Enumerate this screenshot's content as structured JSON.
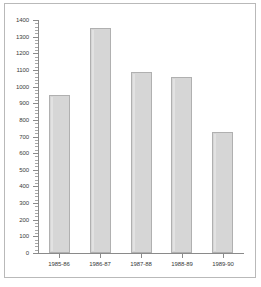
{
  "chart_data": {
    "type": "bar",
    "title": "",
    "subtitle": "",
    "xlabel": "",
    "ylabel": "",
    "categories": [
      "1985-86",
      "1986-87",
      "1987-88",
      "1988-89",
      "1989-90"
    ],
    "values": [
      950,
      1350,
      1085,
      1060,
      725
    ],
    "ylim": [
      0,
      1400
    ],
    "ytick_labels": [
      "0",
      "100",
      "200",
      "300",
      "400",
      "500",
      "600",
      "700",
      "800",
      "900",
      "1000",
      "1100",
      "1200",
      "1300",
      "1400"
    ],
    "ytick_values": [
      0,
      100,
      200,
      300,
      400,
      500,
      600,
      700,
      800,
      900,
      1000,
      1100,
      1200,
      1300,
      1400
    ],
    "ytick_interval": 100,
    "yminor_interval": 20,
    "grid": false,
    "legend": null,
    "legend_position": "none",
    "annotations": [],
    "bar_fill_color": "#d6d6d6",
    "bar_border_color": "#b0b0b0",
    "axis_color": "#8a8a8a",
    "text_color": "#3a3a3a",
    "background_color": "#ffffff",
    "frame_color": "#b9b9b9"
  }
}
